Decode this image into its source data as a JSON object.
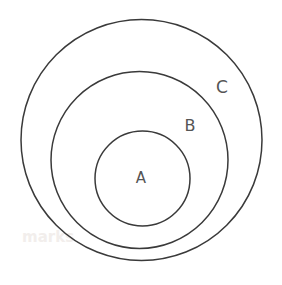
{
  "canvas": {
    "width": 282,
    "height": 285,
    "background_color": "#ffffff"
  },
  "diagram": {
    "kind": "euler-diagram",
    "stroke_color": "#3a3a3a",
    "stroke_width": 1.5,
    "fill": "none",
    "nesting_order": "A ⊂ B ⊂ C",
    "sets": [
      {
        "id": "C",
        "label": "C",
        "role": "outer",
        "cx": 141.5,
        "cy": 140,
        "r": 120.5,
        "label_x": 222,
        "label_y": 88,
        "label_font_size": 17,
        "label_color": "#555555"
      },
      {
        "id": "B",
        "label": "B",
        "role": "middle",
        "cx": 139.5,
        "cy": 160,
        "r": 88.5,
        "label_x": 190,
        "label_y": 126,
        "label_font_size": 16,
        "label_color": "#555555"
      },
      {
        "id": "A",
        "label": "A",
        "role": "inner",
        "cx": 142.5,
        "cy": 178.5,
        "r": 47.5,
        "label_x": 141,
        "label_y": 178,
        "label_font_size": 15,
        "label_color": "#555555"
      }
    ]
  },
  "watermark": {
    "text": "marks",
    "x": 22,
    "y": 237,
    "font_size": 15,
    "color": "#f0ece9",
    "opacity": 0.85
  }
}
